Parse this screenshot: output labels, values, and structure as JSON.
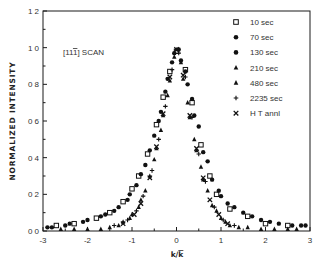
{
  "chart_data": {
    "type": "scatter",
    "title": "",
    "annotation": "[11ī] SCAN",
    "xlabel": "k/k̄",
    "ylabel": "NORMALIZED  INTENSITY",
    "xlim": [
      -3,
      3
    ],
    "ylim": [
      0,
      1.2
    ],
    "x_ticks": [
      -3,
      -2,
      -1,
      0,
      1,
      2,
      3
    ],
    "x_tick_labels": [
      "-3",
      "-2",
      "-1",
      "0",
      "1",
      "2",
      "3"
    ],
    "y_ticks": [
      0.0,
      0.2,
      0.4,
      0.6,
      0.8,
      1.0,
      1.2
    ],
    "y_tick_labels": [
      "0 0",
      "0 2",
      "0 4",
      "0 6",
      "0 8",
      "1 0",
      "1 2"
    ],
    "grid": false,
    "legend_position": "upper right",
    "series": [
      {
        "name": "10 sec",
        "marker": "open-square",
        "x": [
          -2.7,
          -2.3,
          -1.8,
          -1.5,
          -1.2,
          -1.0,
          -0.85,
          -0.65,
          -0.45,
          -0.3,
          -0.15,
          0.0,
          0.2,
          0.35,
          0.55,
          0.75,
          0.9,
          1.2,
          1.6,
          2.0,
          2.5
        ],
        "y": [
          0.03,
          0.04,
          0.07,
          0.1,
          0.16,
          0.23,
          0.3,
          0.42,
          0.58,
          0.73,
          0.87,
          0.98,
          0.88,
          0.7,
          0.47,
          0.3,
          0.2,
          0.12,
          0.08,
          0.04,
          0.03
        ]
      },
      {
        "name": "70 sec",
        "marker": "filled-circle",
        "x": [
          -2.9,
          -2.5,
          -2.1,
          -1.7,
          -1.4,
          -1.1,
          -0.9,
          -0.7,
          -0.5,
          -0.35,
          -0.2,
          -0.05,
          0.1,
          0.25,
          0.4,
          0.6,
          0.8,
          1.0,
          1.3,
          1.7,
          2.1,
          2.6,
          2.9
        ],
        "y": [
          0.02,
          0.03,
          0.05,
          0.08,
          0.11,
          0.17,
          0.25,
          0.36,
          0.52,
          0.65,
          0.83,
          0.97,
          0.93,
          0.8,
          0.63,
          0.43,
          0.28,
          0.19,
          0.13,
          0.08,
          0.05,
          0.03,
          0.03
        ]
      },
      {
        "name": "130 sec",
        "marker": "filled-circle",
        "x": [
          -2.8,
          -2.4,
          -2.0,
          -1.6,
          -1.3,
          -1.05,
          -0.8,
          -0.6,
          -0.4,
          -0.25,
          -0.1,
          0.05,
          0.2,
          0.35,
          0.5,
          0.7,
          0.95,
          1.15,
          1.5,
          1.9,
          2.3,
          2.8
        ],
        "y": [
          0.02,
          0.04,
          0.06,
          0.09,
          0.13,
          0.2,
          0.31,
          0.44,
          0.6,
          0.76,
          0.92,
          0.99,
          0.87,
          0.72,
          0.57,
          0.38,
          0.22,
          0.15,
          0.1,
          0.06,
          0.04,
          0.03
        ]
      },
      {
        "name": "210 sec",
        "marker": "filled-triangle",
        "x": [
          -2.6,
          -2.0,
          -1.5,
          -1.2,
          -1.0,
          -0.8,
          -0.6,
          -0.45,
          -0.3,
          -0.15,
          0.0,
          0.15,
          0.3,
          0.45,
          0.6,
          0.8,
          1.0,
          1.2,
          1.6,
          2.2,
          2.7
        ],
        "y": [
          0.01,
          0.01,
          0.02,
          0.05,
          0.09,
          0.17,
          0.3,
          0.45,
          0.63,
          0.82,
          0.99,
          0.83,
          0.62,
          0.44,
          0.28,
          0.14,
          0.07,
          0.03,
          0.02,
          0.01,
          0.01
        ]
      },
      {
        "name": "480 sec",
        "marker": "filled-triangle",
        "x": [
          -2.3,
          -1.7,
          -1.3,
          -1.05,
          -0.85,
          -0.7,
          -0.5,
          -0.35,
          -0.2,
          -0.05,
          0.1,
          0.25,
          0.4,
          0.55,
          0.7,
          0.9,
          1.1,
          1.4,
          1.9,
          2.5
        ],
        "y": [
          0.01,
          0.01,
          0.03,
          0.07,
          0.13,
          0.22,
          0.39,
          0.55,
          0.74,
          0.95,
          0.92,
          0.7,
          0.5,
          0.35,
          0.22,
          0.11,
          0.05,
          0.02,
          0.01,
          0.01
        ]
      },
      {
        "name": "2235 sec",
        "marker": "plus",
        "x": [
          -1.4,
          -1.1,
          -0.9,
          -0.75,
          -0.55,
          -0.4,
          -0.25,
          -0.1,
          0.05,
          0.2,
          0.35,
          0.5,
          0.65,
          0.85,
          1.05,
          1.3
        ],
        "y": [
          0.03,
          0.06,
          0.11,
          0.19,
          0.33,
          0.5,
          0.68,
          0.88,
          0.97,
          0.84,
          0.62,
          0.42,
          0.27,
          0.13,
          0.06,
          0.03
        ]
      },
      {
        "name": "H T annl",
        "marker": "x-cross",
        "x": [
          -1.2,
          -0.95,
          -0.8,
          -0.6,
          -0.45,
          -0.3,
          -0.15,
          0.0,
          0.15,
          0.3,
          0.45,
          0.6,
          0.75,
          0.95,
          1.15
        ],
        "y": [
          0.04,
          0.09,
          0.15,
          0.29,
          0.46,
          0.64,
          0.84,
          0.99,
          0.85,
          0.63,
          0.45,
          0.29,
          0.17,
          0.09,
          0.04
        ]
      }
    ]
  },
  "labels": {
    "annotation_prefix": "[11",
    "annotation_index": "1",
    "annotation_suffix": "] SCAN",
    "ylabel": "NORMALIZED  INTENSITY",
    "xlabel_num": "k/",
    "xlabel_den": "k"
  },
  "colors": {
    "axis": "#1a1a1a",
    "marker": "#111111",
    "background": "#ffffff",
    "text": "#333333"
  }
}
